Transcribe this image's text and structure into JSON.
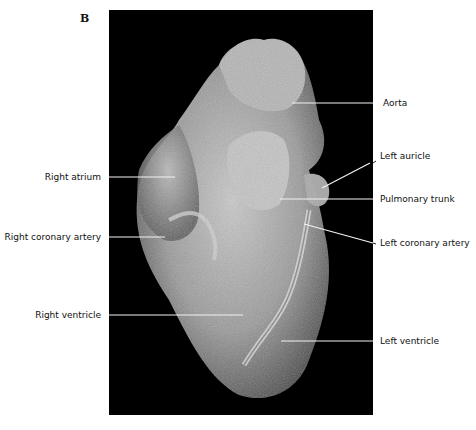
{
  "figure": {
    "panel_letter": "B",
    "background_color": "#000000",
    "labels": [
      {
        "id": "aorta",
        "text": "Aorta",
        "side": "right"
      },
      {
        "id": "left-auricle",
        "text": "Left auricle",
        "side": "right"
      },
      {
        "id": "pulmonary-trunk",
        "text": "Pulmonary trunk",
        "side": "right"
      },
      {
        "id": "left-coronary-artery",
        "text": "Left coronary artery",
        "side": "right"
      },
      {
        "id": "left-ventricle",
        "text": "Left ventricle",
        "side": "right"
      },
      {
        "id": "right-atrium",
        "text": "Right atrium",
        "side": "left"
      },
      {
        "id": "right-coronary-artery",
        "text": "Right coronary artery",
        "side": "left"
      },
      {
        "id": "right-ventricle",
        "text": "Right ventricle",
        "side": "left"
      }
    ]
  }
}
